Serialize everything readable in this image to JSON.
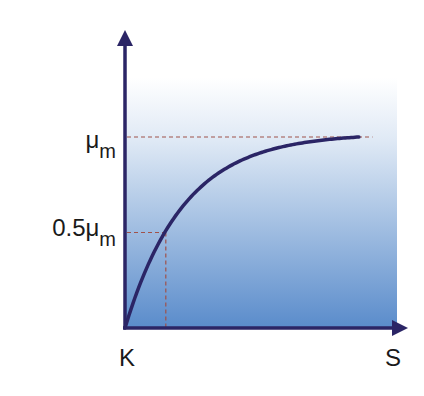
{
  "chart_data": {
    "type": "line",
    "title": "",
    "xlabel": "S",
    "ylabel": "",
    "x_origin_label": "K",
    "curve": "saturating (Monod / Michaelis-Menten type)",
    "y_ticks": [
      {
        "value": 1.0,
        "base": "μ",
        "sub": "m",
        "prefix": ""
      },
      {
        "value": 0.5,
        "base": "μ",
        "sub": "m",
        "prefix": "0.5"
      }
    ],
    "ks_fraction_of_x": 0.15,
    "xlim": [
      0,
      1
    ],
    "ylim": [
      0,
      1.38
    ],
    "reference_lines": [
      {
        "type": "horizontal",
        "y": 1.0,
        "style": "dashed"
      },
      {
        "type": "horizontal",
        "y": 0.5,
        "style": "dashed",
        "to_x": "Ks"
      },
      {
        "type": "vertical",
        "x": "Ks",
        "style": "dashed",
        "to_y": 0.5
      }
    ],
    "colors": {
      "axis": "#2b2566",
      "curve": "#2b2566",
      "dashed": "#a0524a",
      "gradient_top": "#ffffff",
      "gradient_bottom": "#5a8ccb"
    },
    "grid": false,
    "legend": "none"
  }
}
